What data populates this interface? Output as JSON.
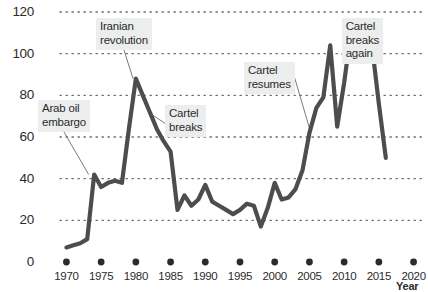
{
  "chart_data": {
    "type": "line",
    "title": "",
    "xlabel": "Year",
    "ylabel": "",
    "xlim": [
      1968.5,
      2021.5
    ],
    "ylim": [
      0,
      120
    ],
    "grid": "horizontal-dotted",
    "legend": "none",
    "line_color": "#4d4d4d",
    "x": [
      1970,
      1971,
      1972,
      1973,
      1974,
      1975,
      1976,
      1977,
      1978,
      1979,
      1980,
      1981,
      1982,
      1983,
      1984,
      1985,
      1986,
      1987,
      1988,
      1989,
      1990,
      1991,
      1992,
      1993,
      1994,
      1995,
      1996,
      1997,
      1998,
      1999,
      2000,
      2001,
      2002,
      2003,
      2004,
      2005,
      2006,
      2007,
      2008,
      2009,
      2010,
      2011,
      2012,
      2013,
      2014,
      2015,
      2016
    ],
    "values": [
      7,
      8,
      9,
      11,
      42,
      36,
      38,
      39,
      38,
      64,
      88,
      80,
      72,
      64,
      58,
      53,
      25,
      32,
      27,
      30,
      37,
      29,
      27,
      25,
      23,
      25,
      28,
      27,
      17,
      26,
      38,
      30,
      31,
      35,
      44,
      62,
      74,
      79,
      104,
      65,
      86,
      111,
      115,
      113,
      104,
      76,
      50
    ],
    "xticks": [
      1970,
      1975,
      1980,
      1985,
      1990,
      1995,
      2000,
      2005,
      2010,
      2015,
      2020
    ],
    "xtick_labels": [
      "1970",
      "1975",
      "1980",
      "1985",
      "1990",
      "1995",
      "2000",
      "2005",
      "2010",
      "2015",
      "2020"
    ],
    "yticks": [
      0,
      20,
      40,
      60,
      80,
      100,
      120
    ],
    "ytick_labels": [
      "0",
      "20",
      "40",
      "60",
      "80",
      "100",
      "120"
    ],
    "annotations": [
      {
        "id": "arab-oil-embargo",
        "text": "Arab oil\nembargo",
        "point_x": 1973.2,
        "point_y": 42,
        "box_x": 38,
        "box_y": 100
      },
      {
        "id": "iranian-revolution",
        "text": "Iranian\nrevolution",
        "point_x": 1979.6,
        "point_y": 88,
        "box_x": 96,
        "box_y": 18
      },
      {
        "id": "cartel-breaks",
        "text": "Cartel\nbreaks",
        "point_x": 1982.2,
        "point_y": 71,
        "box_x": 165,
        "box_y": 105
      },
      {
        "id": "cartel-resumes",
        "text": "Cartel\nresumes",
        "point_x": 2005.2,
        "point_y": 62,
        "box_x": 244,
        "box_y": 62
      },
      {
        "id": "cartel-breaks-again",
        "text": "Cartel\nbreaks\nagain",
        "box_x": 383,
        "box_y": 18,
        "point_x": 2012.9,
        "point_y": 101
      }
    ]
  },
  "axes": {
    "y_title": "",
    "x_title": "Year"
  }
}
